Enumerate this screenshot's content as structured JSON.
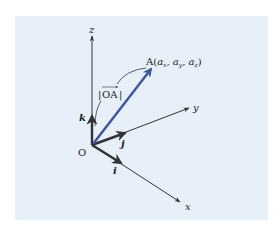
{
  "figure": {
    "background_color": "#ffffff",
    "panel_color": "#e7eff9",
    "axis_color": "#333333",
    "vector_color": "#3a55a8",
    "origin": {
      "label": "O"
    },
    "axes": [
      {
        "name": "x",
        "label": "x"
      },
      {
        "name": "y",
        "label": "y"
      },
      {
        "name": "z",
        "label": "z"
      }
    ],
    "unit_vectors": [
      {
        "name": "i",
        "label": "i",
        "axis": "x"
      },
      {
        "name": "j",
        "label": "j",
        "axis": "y"
      },
      {
        "name": "k",
        "label": "k",
        "axis": "z"
      }
    ],
    "position_vector": {
      "from": "O",
      "to": "A",
      "point_label": "A(",
      "components": [
        "a",
        "x",
        ", a",
        "y",
        ", a",
        "z",
        ")"
      ],
      "magnitude_label": "|OA|",
      "magnitude_label_inner": "OA"
    }
  }
}
